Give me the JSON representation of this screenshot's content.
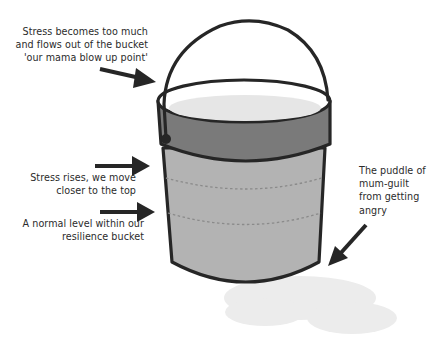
{
  "diagram": {
    "title": "Resilience bucket",
    "colors": {
      "outline": "#262626",
      "band": "#7a7a7a",
      "body": "#b3b3b3",
      "water_surface": "#e6e6e6",
      "dashes": "#8a8a8a",
      "puddle": "#ececec",
      "text": "#2b2b2b"
    },
    "labels": {
      "overflow": {
        "line1": "Stress becomes too much",
        "line2": "and flows out of the bucket",
        "line3": "'our mama blow up point'"
      },
      "rising": {
        "line1": "Stress rises, we move",
        "line2": "closer to the top"
      },
      "normal": {
        "line1": "A normal level within our",
        "line2": "resilience bucket"
      },
      "puddle": {
        "line1": "The puddle of",
        "line2": "mum-guilt",
        "line3": "from getting",
        "line4": "angry"
      }
    },
    "elements": [
      "handle",
      "rim",
      "band",
      "bucket-body",
      "stress-level-lines",
      "puddle",
      "arrows"
    ]
  }
}
